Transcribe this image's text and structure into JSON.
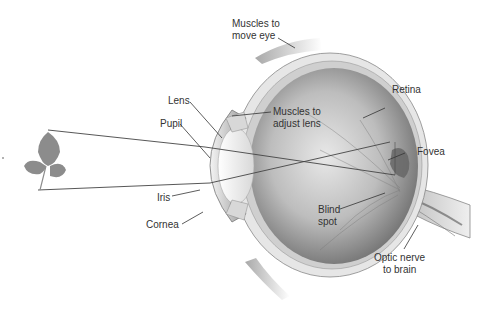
{
  "diagram": {
    "type": "anatomy",
    "labels": {
      "muscles_move_eye": "Muscles to\nmove eye",
      "retina": "Retina",
      "lens": "Lens",
      "muscles_adjust_lens": "Muscles to\nadjust lens",
      "pupil": "Pupil",
      "fovea": "Fovea",
      "iris": "Iris",
      "cornea": "Cornea",
      "blind_spot": "Blind\nspot",
      "optic_nerve": "Optic nerve\nto brain"
    },
    "colors": {
      "background": "#ffffff",
      "eye_interior": "#9a9a9a",
      "sclera": "#e4e4e4",
      "leader_line": "#333333",
      "ray_line": "#444444",
      "leaf": "#8c8c8c"
    }
  }
}
